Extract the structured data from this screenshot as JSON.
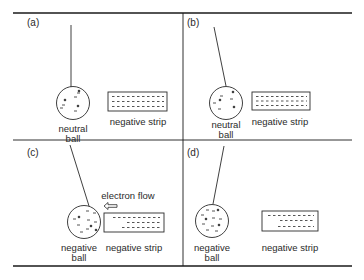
{
  "figure": {
    "frame_color": "#1a1a1a",
    "panels": [
      {
        "id": "a",
        "tag": "(a)",
        "ball_label_line1": "neutral",
        "ball_label_line2": "ball",
        "strip_label": "negative strip",
        "ball_charge": "neutral",
        "strip_charge": "negative"
      },
      {
        "id": "b",
        "tag": "(b)",
        "ball_label_line1": "neutral",
        "ball_label_line2": "ball",
        "strip_label": "negative strip",
        "ball_charge": "neutral",
        "strip_charge": "negative"
      },
      {
        "id": "c",
        "tag": "(c)",
        "ball_label_line1": "negative",
        "ball_label_line2": "ball",
        "strip_label": "negative strip",
        "annotation": "electron flow",
        "ball_charge": "negative",
        "strip_charge": "negative"
      },
      {
        "id": "d",
        "tag": "(d)",
        "ball_label_line1": "negative",
        "ball_label_line2": "ball",
        "strip_label": "negative strip",
        "ball_charge": "negative",
        "strip_charge": "negative"
      }
    ]
  }
}
